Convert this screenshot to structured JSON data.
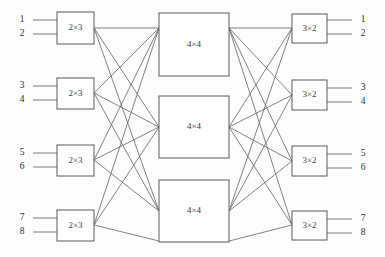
{
  "diagram": {
    "type": "clos-network",
    "background_color": "#fdfdfd",
    "line_color": "#6b6b6b",
    "box_stroke_color": "#5a5a5a",
    "box_fill_color": "#ffffff",
    "text_color": "#2e2e2e"
  },
  "stages": {
    "ingress": {
      "label": "2×3",
      "count": 4,
      "boxes": [
        {
          "label": "2×3",
          "x": 57,
          "y": 12,
          "w": 37,
          "h": 32,
          "cx": 75.5,
          "cy": 28
        },
        {
          "label": "2×3",
          "x": 57,
          "y": 78,
          "w": 37,
          "h": 31,
          "cx": 75.5,
          "cy": 93.5
        },
        {
          "label": "2×3",
          "x": 57,
          "y": 145,
          "w": 37,
          "h": 31,
          "cx": 75.5,
          "cy": 160.5
        },
        {
          "label": "2×3",
          "x": 57,
          "y": 210,
          "w": 37,
          "h": 31,
          "cx": 75.5,
          "cy": 225.5
        }
      ]
    },
    "middle": {
      "label": "4×4",
      "count": 3,
      "boxes": [
        {
          "label": "4×4",
          "x": 159,
          "y": 13,
          "w": 70,
          "h": 63,
          "cx": 194,
          "cy": 44.5
        },
        {
          "label": "4×4",
          "x": 159,
          "y": 96,
          "w": 70,
          "h": 62,
          "cx": 194,
          "cy": 127
        },
        {
          "label": "4×4",
          "x": 159,
          "y": 180,
          "w": 70,
          "h": 62,
          "cx": 194,
          "cy": 211
        }
      ]
    },
    "egress": {
      "label": "3×2",
      "count": 4,
      "boxes": [
        {
          "label": "3×2",
          "x": 292,
          "y": 14,
          "w": 35,
          "h": 29,
          "cx": 309.5,
          "cy": 28.5
        },
        {
          "label": "3×2",
          "x": 292,
          "y": 80,
          "w": 35,
          "h": 30,
          "cx": 309.5,
          "cy": 95
        },
        {
          "label": "3×2",
          "x": 292,
          "y": 146,
          "w": 35,
          "h": 30,
          "cx": 309.5,
          "cy": 161
        },
        {
          "label": "3×2",
          "x": 292,
          "y": 211,
          "w": 35,
          "h": 29,
          "cx": 309.5,
          "cy": 225.5
        }
      ]
    }
  },
  "input_ports": [
    {
      "label": "1",
      "lx": 22,
      "ly": 15,
      "line_y": 20,
      "x1": 33,
      "x2": 57
    },
    {
      "label": "2",
      "lx": 22,
      "ly": 29,
      "line_y": 34,
      "x1": 33,
      "x2": 57
    },
    {
      "label": "3",
      "lx": 22,
      "ly": 81,
      "line_y": 86,
      "x1": 33,
      "x2": 57
    },
    {
      "label": "4",
      "lx": 22,
      "ly": 95,
      "line_y": 100,
      "x1": 33,
      "x2": 57
    },
    {
      "label": "5",
      "lx": 22,
      "ly": 148,
      "line_y": 153,
      "x1": 33,
      "x2": 57
    },
    {
      "label": "6",
      "lx": 22,
      "ly": 162,
      "line_y": 167,
      "x1": 33,
      "x2": 57
    },
    {
      "label": "7",
      "lx": 22,
      "ly": 213,
      "line_y": 218,
      "x1": 33,
      "x2": 57
    },
    {
      "label": "8",
      "lx": 22,
      "ly": 227,
      "line_y": 232,
      "x1": 33,
      "x2": 57
    }
  ],
  "output_ports": [
    {
      "label": "1",
      "lx": 363,
      "ly": 15,
      "line_y": 20,
      "x1": 327,
      "x2": 352
    },
    {
      "label": "2",
      "lx": 363,
      "ly": 29,
      "line_y": 34,
      "x1": 327,
      "x2": 352
    },
    {
      "label": "3",
      "lx": 363,
      "ly": 83,
      "line_y": 88,
      "x1": 327,
      "x2": 352
    },
    {
      "label": "4",
      "lx": 363,
      "ly": 97,
      "line_y": 102,
      "x1": 327,
      "x2": 352
    },
    {
      "label": "5",
      "lx": 363,
      "ly": 149,
      "line_y": 154,
      "x1": 327,
      "x2": 352
    },
    {
      "label": "6",
      "lx": 363,
      "ly": 163,
      "line_y": 168,
      "x1": 327,
      "x2": 352
    },
    {
      "label": "7",
      "lx": 363,
      "ly": 214,
      "line_y": 219,
      "x1": 327,
      "x2": 352
    },
    {
      "label": "8",
      "lx": 363,
      "ly": 228,
      "line_y": 233,
      "x1": 327,
      "x2": 352
    }
  ],
  "links_left": [
    {
      "from": 0,
      "to": 0,
      "x1": 94,
      "y1": 28,
      "x2": 159,
      "y2": 28
    },
    {
      "from": 0,
      "to": 1,
      "x1": 94,
      "y1": 28,
      "x2": 159,
      "y2": 127
    },
    {
      "from": 0,
      "to": 2,
      "x1": 94,
      "y1": 28,
      "x2": 159,
      "y2": 211
    },
    {
      "from": 1,
      "to": 0,
      "x1": 94,
      "y1": 93,
      "x2": 159,
      "y2": 28
    },
    {
      "from": 1,
      "to": 1,
      "x1": 94,
      "y1": 93,
      "x2": 159,
      "y2": 127
    },
    {
      "from": 1,
      "to": 2,
      "x1": 94,
      "y1": 93,
      "x2": 159,
      "y2": 211
    },
    {
      "from": 2,
      "to": 0,
      "x1": 94,
      "y1": 160,
      "x2": 159,
      "y2": 28
    },
    {
      "from": 2,
      "to": 1,
      "x1": 94,
      "y1": 160,
      "x2": 159,
      "y2": 127
    },
    {
      "from": 2,
      "to": 2,
      "x1": 94,
      "y1": 160,
      "x2": 159,
      "y2": 211
    },
    {
      "from": 3,
      "to": 0,
      "x1": 94,
      "y1": 225,
      "x2": 159,
      "y2": 28
    },
    {
      "from": 3,
      "to": 1,
      "x1": 94,
      "y1": 225,
      "x2": 159,
      "y2": 127
    },
    {
      "from": 3,
      "to": 2,
      "x1": 94,
      "y1": 225,
      "x2": 159,
      "y2": 241
    }
  ],
  "links_right": [
    {
      "from": 0,
      "to": 0,
      "x1": 229,
      "y1": 28,
      "x2": 292,
      "y2": 28
    },
    {
      "from": 0,
      "to": 1,
      "x1": 229,
      "y1": 28,
      "x2": 292,
      "y2": 95
    },
    {
      "from": 0,
      "to": 2,
      "x1": 229,
      "y1": 28,
      "x2": 292,
      "y2": 161
    },
    {
      "from": 0,
      "to": 3,
      "x1": 229,
      "y1": 28,
      "x2": 292,
      "y2": 225
    },
    {
      "from": 1,
      "to": 0,
      "x1": 229,
      "y1": 127,
      "x2": 292,
      "y2": 28
    },
    {
      "from": 1,
      "to": 1,
      "x1": 229,
      "y1": 127,
      "x2": 292,
      "y2": 95
    },
    {
      "from": 1,
      "to": 2,
      "x1": 229,
      "y1": 127,
      "x2": 292,
      "y2": 161
    },
    {
      "from": 1,
      "to": 3,
      "x1": 229,
      "y1": 127,
      "x2": 292,
      "y2": 225
    },
    {
      "from": 2,
      "to": 0,
      "x1": 229,
      "y1": 211,
      "x2": 292,
      "y2": 28
    },
    {
      "from": 2,
      "to": 1,
      "x1": 229,
      "y1": 211,
      "x2": 292,
      "y2": 95
    },
    {
      "from": 2,
      "to": 2,
      "x1": 229,
      "y1": 211,
      "x2": 292,
      "y2": 161
    },
    {
      "from": 2,
      "to": 3,
      "x1": 229,
      "y1": 241,
      "x2": 292,
      "y2": 225
    }
  ]
}
